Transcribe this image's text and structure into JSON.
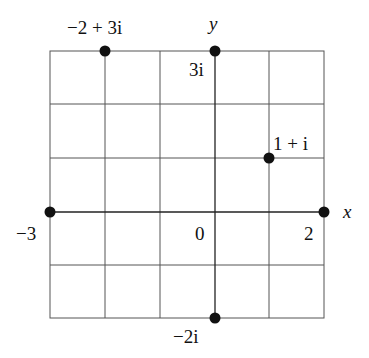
{
  "diagram": {
    "type": "complex-plane",
    "axes": {
      "x_label": "x",
      "y_label": "y"
    },
    "grid": {
      "x_range": [
        -3,
        2
      ],
      "y_range": [
        -2,
        3
      ],
      "step": 1
    },
    "tick_labels": {
      "origin": "0",
      "x_min": "−3",
      "x_max": "2",
      "y_max": "3i",
      "y_min": "−2i"
    },
    "points": [
      {
        "label": "−2 + 3i",
        "re": -2,
        "im": 3
      },
      {
        "label": "3i",
        "re": 0,
        "im": 3
      },
      {
        "label": "1 + i",
        "re": 1,
        "im": 1
      },
      {
        "label": "−3",
        "re": -3,
        "im": 0
      },
      {
        "label": "2",
        "re": 2,
        "im": 0
      },
      {
        "label": "−2i",
        "re": 0,
        "im": -2
      }
    ],
    "colors": {
      "grid": "#555555",
      "point": "#111111"
    }
  }
}
